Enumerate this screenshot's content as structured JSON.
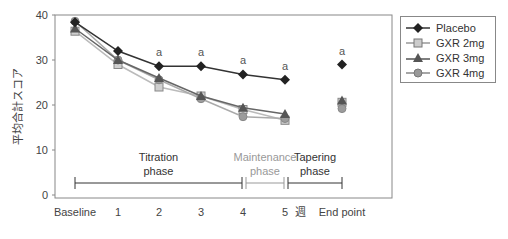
{
  "chart_data": {
    "type": "line",
    "title": "",
    "xlabel": "週",
    "ylabel": "平均合計スコア",
    "ylim": [
      0,
      40
    ],
    "yticks": [
      0,
      10,
      20,
      30,
      40
    ],
    "categories": [
      "Baseline",
      "1",
      "2",
      "3",
      "4",
      "5",
      "End point"
    ],
    "x_unit_label": "週",
    "grid": false,
    "legend_position": "right-top",
    "series": [
      {
        "name": "Placebo",
        "marker": "diamond",
        "color": "#333333",
        "values": [
          38.4,
          32.0,
          28.6,
          28.6,
          26.8,
          25.6,
          29.0
        ]
      },
      {
        "name": "GXR 2mg",
        "marker": "square",
        "color": "#b5b5b5",
        "values": [
          36.4,
          29.0,
          24.0,
          22.0,
          19.0,
          16.6,
          20.6
        ]
      },
      {
        "name": "GXR 3mg",
        "marker": "triangle",
        "color": "#6e6e6e",
        "values": [
          37.0,
          30.0,
          26.0,
          22.0,
          19.4,
          18.0,
          21.0
        ]
      },
      {
        "name": "GXR 4mg",
        "marker": "circle",
        "color": "#9a9a9a",
        "values": [
          38.6,
          30.0,
          25.6,
          21.4,
          17.4,
          17.0,
          19.2
        ]
      }
    ],
    "annotations": [
      {
        "category": "2",
        "text": "a"
      },
      {
        "category": "3",
        "text": "a"
      },
      {
        "category": "4",
        "text": "a"
      },
      {
        "category": "5",
        "text": "a"
      },
      {
        "category": "End point",
        "text": "a"
      }
    ],
    "phases": [
      {
        "label_line1": "Titration",
        "label_line2": "phase",
        "from": "Baseline",
        "to": "4",
        "color": "#333333"
      },
      {
        "label_line1": "Maintenance",
        "label_line2": "phase",
        "from": "4",
        "to": "5",
        "color": "#999999"
      },
      {
        "label_line1": "Tapering",
        "label_line2": "phase",
        "from": "5",
        "to": "End point",
        "color": "#333333"
      }
    ]
  },
  "legend": {
    "items": [
      {
        "label": "Placebo"
      },
      {
        "label": "GXR 2mg"
      },
      {
        "label": "GXR 3mg"
      },
      {
        "label": "GXR 4mg"
      }
    ]
  }
}
